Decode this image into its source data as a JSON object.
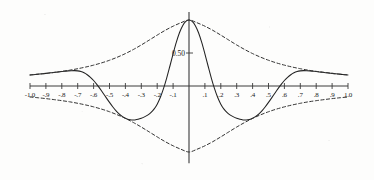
{
  "chart_data": {
    "type": "line",
    "title": "",
    "subtitle": "",
    "xlabel": "",
    "ylabel": "",
    "xlim": [
      -1.0,
      1.0
    ],
    "ylim": [
      -1.12,
      1.12
    ],
    "grid": false,
    "legend": null,
    "x_tick_labels": [
      "-1.0",
      "-.9",
      "-.8",
      "-.7",
      "-.6",
      "-.5",
      "-.4",
      "-.3",
      "-.2",
      "-.1",
      ".1",
      ".2",
      ".3",
      ".4",
      ".5",
      ".6",
      ".7",
      ".8",
      ".9",
      "1.0"
    ],
    "x_tick_values": [
      -1.0,
      -0.9,
      -0.8,
      -0.7,
      -0.6,
      -0.5,
      -0.4,
      -0.3,
      -0.2,
      -0.1,
      0.1,
      0.2,
      0.3,
      0.4,
      0.5,
      0.6,
      0.7,
      0.8,
      0.9,
      1.0
    ],
    "y_tick_labels": [
      "0.50"
    ],
    "y_tick_values": [
      0.5
    ],
    "axis_color": "#3a3a3a",
    "curve_color": "#222222",
    "envelope_color": "#333333",
    "series": [
      {
        "name": "oscillating-curve",
        "style": "solid",
        "x": [
          -1.0,
          -0.98,
          -0.96,
          -0.94,
          -0.92,
          -0.9,
          -0.88,
          -0.86,
          -0.84,
          -0.82,
          -0.8,
          -0.78,
          -0.76,
          -0.74,
          -0.72,
          -0.7,
          -0.68,
          -0.66,
          -0.64,
          -0.62,
          -0.6,
          -0.58,
          -0.56,
          -0.54,
          -0.52,
          -0.5,
          -0.48,
          -0.46,
          -0.44,
          -0.42,
          -0.4,
          -0.38,
          -0.36,
          -0.34,
          -0.32,
          -0.3,
          -0.28,
          -0.26,
          -0.24,
          -0.22,
          -0.2,
          -0.18,
          -0.16,
          -0.14,
          -0.12,
          -0.1,
          -0.08,
          -0.06,
          -0.04,
          -0.02,
          0.0,
          0.02,
          0.04,
          0.06,
          0.08,
          0.1,
          0.12,
          0.14,
          0.16,
          0.18,
          0.2,
          0.22,
          0.24,
          0.26,
          0.28,
          0.3,
          0.32,
          0.34,
          0.36,
          0.38,
          0.4,
          0.42,
          0.44,
          0.46,
          0.48,
          0.5,
          0.52,
          0.54,
          0.56,
          0.58,
          0.6,
          0.62,
          0.64,
          0.66,
          0.68,
          0.7,
          0.72,
          0.74,
          0.76,
          0.78,
          0.8,
          0.82,
          0.84,
          0.86,
          0.88,
          0.9,
          0.92,
          0.94,
          0.96,
          0.98,
          1.0
        ],
        "y": [
          0.167,
          0.171,
          0.176,
          0.181,
          0.186,
          0.191,
          0.197,
          0.202,
          0.208,
          0.213,
          0.219,
          0.224,
          0.229,
          0.232,
          0.233,
          0.229,
          0.219,
          0.2,
          0.171,
          0.132,
          0.083,
          0.025,
          -0.04,
          -0.109,
          -0.18,
          -0.249,
          -0.314,
          -0.372,
          -0.421,
          -0.46,
          -0.489,
          -0.507,
          -0.515,
          -0.514,
          -0.505,
          -0.489,
          -0.468,
          -0.441,
          -0.404,
          -0.351,
          -0.275,
          -0.171,
          -0.037,
          0.124,
          0.303,
          0.487,
          0.66,
          0.806,
          0.914,
          0.978,
          1.0,
          0.978,
          0.914,
          0.806,
          0.66,
          0.487,
          0.303,
          0.124,
          -0.037,
          -0.171,
          -0.275,
          -0.351,
          -0.404,
          -0.441,
          -0.468,
          -0.489,
          -0.505,
          -0.514,
          -0.515,
          -0.507,
          -0.489,
          -0.46,
          -0.421,
          -0.372,
          -0.314,
          -0.249,
          -0.18,
          -0.109,
          -0.04,
          0.025,
          0.083,
          0.132,
          0.171,
          0.2,
          0.219,
          0.229,
          0.233,
          0.232,
          0.229,
          0.224,
          0.219,
          0.213,
          0.208,
          0.202,
          0.197,
          0.191,
          0.186,
          0.181,
          0.176,
          0.171,
          0.167
        ]
      },
      {
        "name": "upper-envelope",
        "style": "dashed",
        "x": [
          -1.0,
          -0.95,
          -0.9,
          -0.85,
          -0.8,
          -0.75,
          -0.7,
          -0.65,
          -0.6,
          -0.55,
          -0.5,
          -0.45,
          -0.4,
          -0.35,
          -0.3,
          -0.25,
          -0.2,
          -0.15,
          -0.1,
          -0.05,
          0.0,
          0.05,
          0.1,
          0.15,
          0.2,
          0.25,
          0.3,
          0.35,
          0.4,
          0.45,
          0.5,
          0.55,
          0.6,
          0.65,
          0.7,
          0.75,
          0.8,
          0.85,
          0.9,
          0.95,
          1.0
        ],
        "y": [
          0.167,
          0.178,
          0.191,
          0.206,
          0.222,
          0.24,
          0.262,
          0.287,
          0.316,
          0.35,
          0.39,
          0.437,
          0.491,
          0.553,
          0.622,
          0.696,
          0.771,
          0.843,
          0.906,
          0.959,
          1.0,
          0.959,
          0.906,
          0.843,
          0.771,
          0.696,
          0.622,
          0.553,
          0.491,
          0.437,
          0.39,
          0.35,
          0.316,
          0.287,
          0.262,
          0.24,
          0.222,
          0.206,
          0.191,
          0.178,
          0.167
        ]
      },
      {
        "name": "lower-envelope",
        "style": "dashed",
        "x": [
          -1.0,
          -0.95,
          -0.9,
          -0.85,
          -0.8,
          -0.75,
          -0.7,
          -0.65,
          -0.6,
          -0.55,
          -0.5,
          -0.45,
          -0.4,
          -0.35,
          -0.3,
          -0.25,
          -0.2,
          -0.15,
          -0.1,
          -0.05,
          0.0,
          0.05,
          0.1,
          0.15,
          0.2,
          0.25,
          0.3,
          0.35,
          0.4,
          0.45,
          0.5,
          0.55,
          0.6,
          0.65,
          0.7,
          0.75,
          0.8,
          0.85,
          0.9,
          0.95,
          1.0
        ],
        "y": [
          -0.167,
          -0.178,
          -0.191,
          -0.206,
          -0.222,
          -0.24,
          -0.262,
          -0.287,
          -0.316,
          -0.35,
          -0.39,
          -0.437,
          -0.491,
          -0.553,
          -0.622,
          -0.696,
          -0.771,
          -0.843,
          -0.906,
          -0.959,
          -1.0,
          -0.959,
          -0.906,
          -0.843,
          -0.771,
          -0.696,
          -0.622,
          -0.553,
          -0.491,
          -0.437,
          -0.39,
          -0.35,
          -0.316,
          -0.287,
          -0.262,
          -0.24,
          -0.222,
          -0.206,
          -0.191,
          -0.178,
          -0.167
        ]
      }
    ]
  }
}
